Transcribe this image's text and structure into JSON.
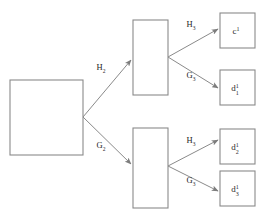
{
  "diagram": {
    "type": "tree-decomposition-diagram",
    "stroke_color": "#8a8a8a",
    "label_color": "#1f1f1f",
    "background": "#ffffff",
    "nodes": [
      {
        "id": "root",
        "label": "",
        "sub": "",
        "sup": "",
        "x": 10,
        "y": 80,
        "w": 73,
        "h": 75
      },
      {
        "id": "mid_upper",
        "label": "",
        "sub": "",
        "sup": "",
        "x": 133,
        "y": 20,
        "w": 35,
        "h": 75
      },
      {
        "id": "mid_lower",
        "label": "",
        "sub": "",
        "sup": "",
        "x": 133,
        "y": 128,
        "w": 35,
        "h": 80
      },
      {
        "id": "leaf_c1",
        "label": "c",
        "sub": "",
        "sup": "1",
        "x": 220,
        "y": 13,
        "w": 35,
        "h": 35
      },
      {
        "id": "leaf_d1",
        "label": "d",
        "sub": "1",
        "sup": "1",
        "x": 220,
        "y": 70,
        "w": 35,
        "h": 35
      },
      {
        "id": "leaf_d2",
        "label": "d",
        "sub": "2",
        "sup": "1",
        "x": 220,
        "y": 129,
        "w": 35,
        "h": 35
      },
      {
        "id": "leaf_d3",
        "label": "d",
        "sub": "3",
        "sup": "1",
        "x": 220,
        "y": 171,
        "w": 35,
        "h": 35
      }
    ],
    "edges": [
      {
        "id": "edge-root-upper",
        "from": "root",
        "to": "mid_upper",
        "label": "H",
        "sub": "2",
        "lx": 101,
        "ly": 70
      },
      {
        "id": "edge-root-lower",
        "from": "root",
        "to": "mid_lower",
        "label": "G",
        "sub": "2",
        "lx": 101,
        "ly": 148
      },
      {
        "id": "edge-upper-c1",
        "from": "mid_upper",
        "to": "leaf_c1",
        "label": "H",
        "sub": "3",
        "lx": 191,
        "ly": 27
      },
      {
        "id": "edge-upper-d1",
        "from": "mid_upper",
        "to": "leaf_d1",
        "label": "G",
        "sub": "3",
        "lx": 191,
        "ly": 78
      },
      {
        "id": "edge-lower-d2",
        "from": "mid_lower",
        "to": "leaf_d2",
        "label": "H",
        "sub": "3",
        "lx": 191,
        "ly": 143
      },
      {
        "id": "edge-lower-d3",
        "from": "mid_lower",
        "to": "leaf_d3",
        "label": "G",
        "sub": "3",
        "lx": 191,
        "ly": 183
      }
    ]
  }
}
